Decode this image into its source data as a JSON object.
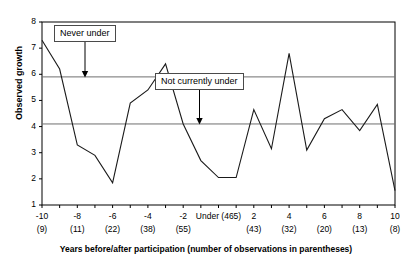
{
  "chart_data": {
    "type": "line",
    "title": "",
    "xlabel": "Years before/after participation (number of observations in parentheses)",
    "ylabel": "Observed growth",
    "xlim": [
      -10,
      10
    ],
    "ylim": [
      1,
      8
    ],
    "grid": false,
    "legend_position": "none",
    "x": [
      -10,
      -9,
      -8,
      -7,
      -6,
      -5,
      -4,
      -3,
      -2,
      -1,
      0,
      1,
      2,
      3,
      4,
      5,
      6,
      7,
      8,
      9,
      10
    ],
    "xtick_labels": [
      "-10",
      "-8",
      "-6",
      "-4",
      "-2",
      "Under (465)",
      "2",
      "4",
      "6",
      "8",
      "10"
    ],
    "xtick_counts": [
      "(9)",
      "(11)",
      "(22)",
      "(38)",
      "(55)",
      "",
      "(43)",
      "(32)",
      "(20)",
      "(13)",
      "(8)"
    ],
    "ytick_labels": [
      "1",
      "2",
      "3",
      "4",
      "5",
      "6",
      "7",
      "8"
    ],
    "series": [
      {
        "name": "Observed growth",
        "values": [
          7.3,
          6.2,
          3.3,
          2.9,
          1.85,
          4.9,
          5.4,
          6.4,
          4.1,
          2.7,
          2.05,
          2.05,
          4.65,
          3.15,
          6.8,
          3.1,
          4.3,
          4.65,
          3.85,
          4.85,
          1.55
        ]
      }
    ],
    "reference_lines": [
      {
        "label": "Never under",
        "value": 5.9
      },
      {
        "label": "Not currently under",
        "value": 4.1
      }
    ],
    "annotations": [
      {
        "label": "Never under",
        "points_to_value": 5.9,
        "points_to_x": -5.6
      },
      {
        "label": "Not currently under",
        "points_to_value": 4.1,
        "points_to_x": 0.35
      }
    ]
  },
  "axes": {
    "ylabel": "Observed growth",
    "xlabel": "Years before/after participation (number of observations in parentheses)"
  },
  "callouts": {
    "never_under": "Never under",
    "not_currently_under": "Not currently under"
  },
  "colors": {
    "line": "#1a1a1a",
    "reference_line": "#6f6f6f",
    "axis": "#000000",
    "background": "#ffffff"
  }
}
